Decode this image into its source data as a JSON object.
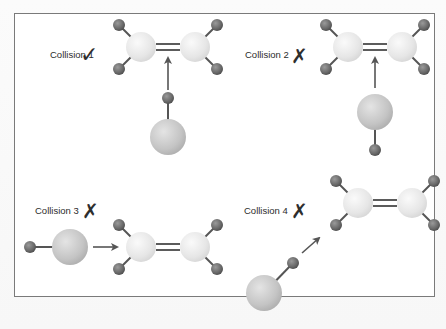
{
  "figure": {
    "colors": {
      "frame": "#7a7a7a",
      "carbon": "#ececec",
      "hydrogen": "#6a6a6a",
      "halogen": "#c6c6c6",
      "bond": "#555555",
      "arrow": "#555555",
      "mark": "#2e2e2e"
    },
    "collisions": [
      {
        "label": "Collision 1",
        "result": "success",
        "mark": "✓"
      },
      {
        "label": "Collision 2",
        "result": "fail",
        "mark": "✗"
      },
      {
        "label": "Collision 3",
        "result": "fail",
        "mark": "✗"
      },
      {
        "label": "Collision 4",
        "result": "fail",
        "mark": "✗"
      }
    ]
  }
}
